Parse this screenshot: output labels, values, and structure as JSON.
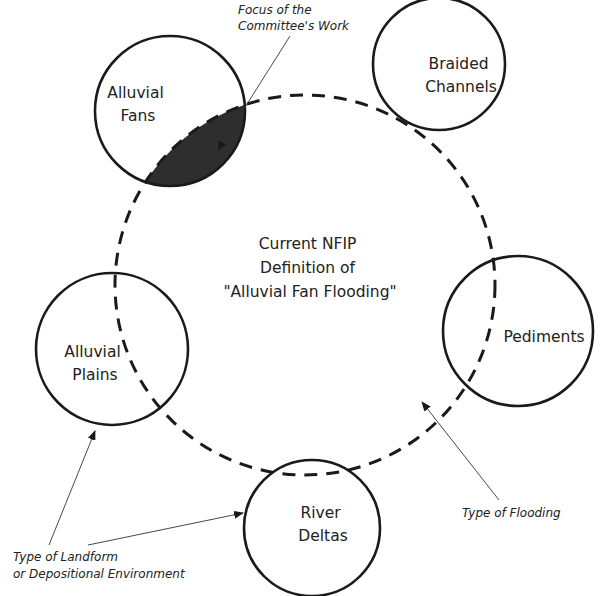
{
  "diagram": {
    "center_label": [
      "Current NFIP",
      "Definition of",
      "\"Alluvial Fan Flooding\""
    ],
    "circles": [
      {
        "id": "alluvial-fans",
        "label": [
          "Alluvial",
          "Fans"
        ]
      },
      {
        "id": "braided-channels",
        "label": [
          "Braided",
          "Channels"
        ]
      },
      {
        "id": "pediments",
        "label": [
          "Pediments"
        ]
      },
      {
        "id": "river-deltas",
        "label": [
          "River",
          "Deltas"
        ]
      },
      {
        "id": "alluvial-plains",
        "label": [
          "Alluvial",
          "Plains"
        ]
      }
    ],
    "annotations": {
      "focus": [
        "Focus of the",
        "Committee's Work"
      ],
      "flooding": [
        "Type of Flooding"
      ],
      "landform": [
        "Type of Landform",
        "or Depositional Environment"
      ]
    },
    "colors": {
      "stroke": "#1a1a1a",
      "focus_fill": "#2e2e2e",
      "background": "#ffffff"
    }
  }
}
